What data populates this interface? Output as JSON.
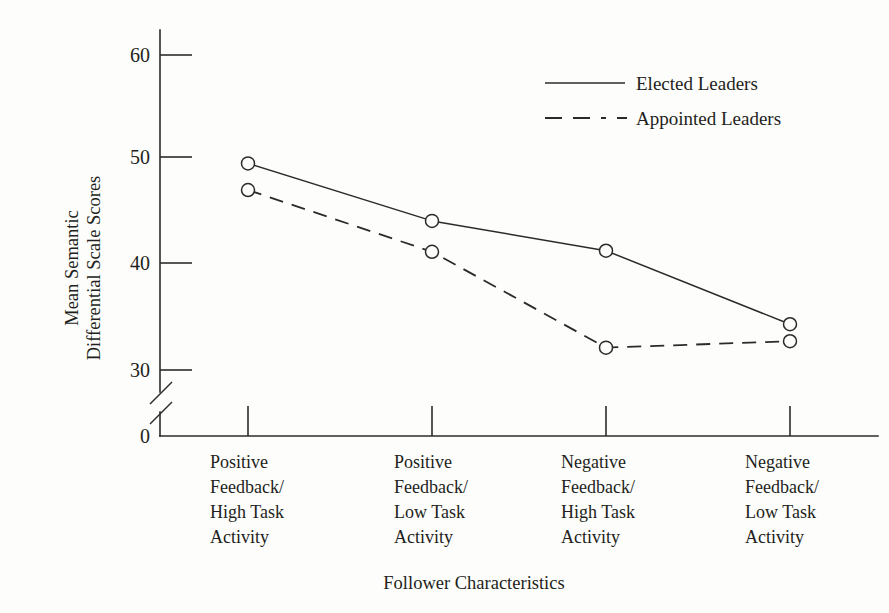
{
  "chart_data": {
    "type": "line",
    "title": "",
    "xlabel": "Follower Characteristics",
    "ylabel": "Mean Semantic\nDifferential Scale Scores",
    "ylabel_line1": "Mean Semantic",
    "ylabel_line2": "Differential Scale Scores",
    "categories": [
      "Positive Feedback/ High Task Activity",
      "Positive Feedback/ Low Task Activity",
      "Negative Feedback/ High Task Activity",
      "Negative Feedback/ Low Task Activity"
    ],
    "category_lines": [
      [
        "Positive",
        "Feedback/",
        "High Task",
        "Activity"
      ],
      [
        "Positive",
        "Feedback/",
        "Low Task",
        "Activity"
      ],
      [
        "Negative",
        "Feedback/",
        "High Task",
        "Activity"
      ],
      [
        "Negative",
        "Feedback/",
        "Low Task",
        "Activity"
      ]
    ],
    "series": [
      {
        "name": "Elected Leaders",
        "style": "solid",
        "values": [
          49.4,
          44.0,
          41.2,
          34.3
        ]
      },
      {
        "name": "Appointed Leaders",
        "style": "dashed",
        "values": [
          46.9,
          41.1,
          32.1,
          32.7
        ]
      }
    ],
    "ytick_labels": [
      "60",
      "50",
      "40",
      "30",
      "0"
    ],
    "ytick_values": [
      60,
      50,
      40,
      30,
      0
    ],
    "ylim": [
      30,
      62
    ],
    "axis_break": true,
    "axis_break_note": "y-axis broken between 0 and 30",
    "grid": false,
    "legend_position": "top-right",
    "marker": "open-circle",
    "colors": {
      "line": "#2b2b2b",
      "marker_fill": "#fdfdfb",
      "background": "#fdfdfb",
      "text": "#231f20"
    }
  },
  "legend": {
    "entries": [
      {
        "label": "Elected Leaders",
        "style": "solid"
      },
      {
        "label": "Appointed Leaders",
        "style": "dashed"
      }
    ]
  },
  "axes": {
    "y_title_line1": "Mean Semantic",
    "y_title_line2": "Differential Scale Scores",
    "x_title": "Follower Characteristics",
    "y_tick_60": "60",
    "y_tick_50": "50",
    "y_tick_40": "40",
    "y_tick_30": "30",
    "y_tick_0": "0"
  },
  "categories_text": {
    "c0_l0": "Positive",
    "c0_l1": "Feedback/",
    "c0_l2": "High Task",
    "c0_l3": "Activity",
    "c1_l0": "Positive",
    "c1_l1": "Feedback/",
    "c1_l2": "Low Task",
    "c1_l3": "Activity",
    "c2_l0": "Negative",
    "c2_l1": "Feedback/",
    "c2_l2": "High Task",
    "c2_l3": "Activity",
    "c3_l0": "Negative",
    "c3_l1": "Feedback/",
    "c3_l2": "Low Task",
    "c3_l3": "Activity"
  }
}
